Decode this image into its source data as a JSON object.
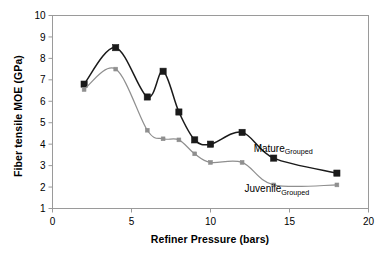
{
  "chart_data": {
    "type": "line",
    "title": "",
    "xlabel": "Refiner Pressure (bars)",
    "ylabel": "Fiber tensile MOE (GPa)",
    "xlim": [
      0,
      20
    ],
    "ylim": [
      1,
      10
    ],
    "xticks": [
      "0",
      "5",
      "10",
      "15",
      "20"
    ],
    "xtick_values": [
      0,
      5,
      10,
      15,
      20
    ],
    "yticks": [
      "1",
      "2",
      "3",
      "4",
      "5",
      "6",
      "7",
      "8",
      "9",
      "10"
    ],
    "ytick_values": [
      1,
      2,
      3,
      4,
      5,
      6,
      7,
      8,
      9,
      10
    ],
    "grid": false,
    "legend_position": "inline-annotations",
    "smoothing": "spline",
    "series": [
      {
        "name": "Mature",
        "name_sub": "Grouped",
        "color": "#1a1a1a",
        "marker": "square",
        "x": [
          2,
          4,
          6,
          7,
          8,
          9,
          10,
          12,
          14,
          18
        ],
        "values": [
          6.8,
          8.5,
          6.2,
          7.4,
          5.5,
          4.2,
          4.0,
          4.55,
          3.35,
          2.65
        ],
        "label_x": 14.6,
        "label_y": 3.65
      },
      {
        "name": "Juvenile",
        "name_sub": "Grouped",
        "color": "#8f8f8f",
        "marker": "square-small",
        "x": [
          2,
          4,
          6,
          7,
          8,
          9,
          10,
          12,
          14,
          18
        ],
        "values": [
          6.55,
          7.5,
          4.65,
          4.25,
          4.2,
          3.55,
          3.15,
          3.15,
          2.1,
          2.1
        ],
        "label_x": 14.2,
        "label_y": 1.75
      }
    ]
  }
}
